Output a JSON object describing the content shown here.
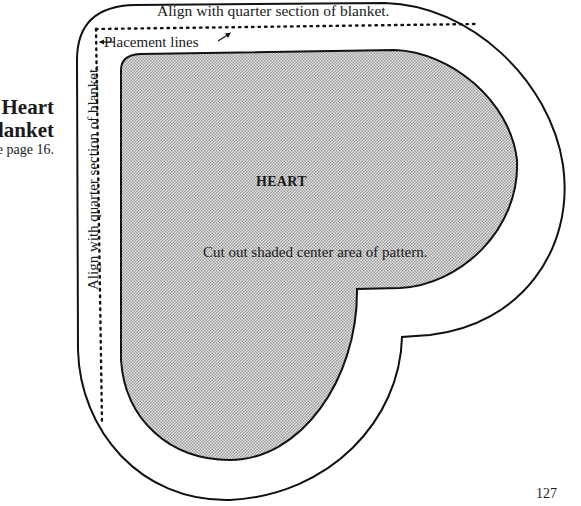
{
  "side_title": {
    "line1": "Heart",
    "line2": "Blanket",
    "line3": "See page 16."
  },
  "pattern": {
    "top_instruction": "Align with quarter section of blanket.",
    "left_instruction": "Align with quarter section of blanket.",
    "placement_lines_label": "Placement lines",
    "shape_label": "HEART",
    "cut_instruction": "Cut out shaded center area of pattern."
  },
  "colors": {
    "outline": "#111111",
    "shade": "#c8c8c8",
    "background": "#ffffff"
  },
  "page_number": "127"
}
